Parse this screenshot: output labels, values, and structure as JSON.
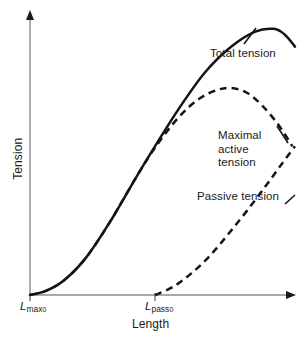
{
  "figure": {
    "background_color": "#ffffff",
    "ink_color": "#151515",
    "axis_color": "#8c8c8c"
  },
  "axes": {
    "y_label": "Tension",
    "x_label": "Length",
    "x_tick_labels": [
      {
        "base": "L",
        "sub": "max",
        "subsub": "0"
      },
      {
        "base": "L",
        "sub": "pass",
        "subsub": "0"
      }
    ]
  },
  "curve_labels": {
    "total": "Total tension",
    "active_line1": "Maximal",
    "active_line2": "active",
    "active_line3": "tension",
    "passive": "Passive tension"
  },
  "chart_data": {
    "type": "line",
    "xlabel": "Length",
    "ylabel": "Tension",
    "xlim": [
      0,
      1
    ],
    "ylim": [
      0,
      1
    ],
    "grid": false,
    "legend": "inline-annotations",
    "axis_ticks": {
      "x": [
        {
          "label": "Lmax0",
          "x": 0.0
        },
        {
          "label": "Lpass0",
          "x": 0.472
        }
      ],
      "y": []
    },
    "series": [
      {
        "name": "Total tension",
        "style": "solid",
        "points": [
          [
            0.0,
            0.0
          ],
          [
            0.06,
            0.015
          ],
          [
            0.13,
            0.055
          ],
          [
            0.21,
            0.135
          ],
          [
            0.3,
            0.265
          ],
          [
            0.4,
            0.43
          ],
          [
            0.472,
            0.545
          ],
          [
            0.56,
            0.68
          ],
          [
            0.66,
            0.815
          ],
          [
            0.76,
            0.91
          ],
          [
            0.85,
            0.965
          ],
          [
            0.92,
            0.975
          ],
          [
            0.96,
            0.955
          ],
          [
            1.0,
            0.91
          ]
        ]
      },
      {
        "name": "Maximal active tension",
        "style": "dashed",
        "points": [
          [
            0.0,
            0.0
          ],
          [
            0.06,
            0.015
          ],
          [
            0.13,
            0.055
          ],
          [
            0.21,
            0.135
          ],
          [
            0.3,
            0.265
          ],
          [
            0.4,
            0.43
          ],
          [
            0.472,
            0.54
          ],
          [
            0.56,
            0.65
          ],
          [
            0.64,
            0.72
          ],
          [
            0.71,
            0.752
          ],
          [
            0.76,
            0.758
          ],
          [
            0.82,
            0.74
          ],
          [
            0.88,
            0.69
          ],
          [
            0.94,
            0.62
          ],
          [
            0.99,
            0.545
          ]
        ]
      },
      {
        "name": "Passive tension",
        "style": "dashed",
        "points": [
          [
            0.472,
            0.0
          ],
          [
            0.54,
            0.03
          ],
          [
            0.61,
            0.08
          ],
          [
            0.68,
            0.145
          ],
          [
            0.75,
            0.225
          ],
          [
            0.82,
            0.31
          ],
          [
            0.89,
            0.4
          ],
          [
            0.95,
            0.48
          ],
          [
            1.0,
            0.545
          ]
        ]
      }
    ],
    "annotations": [
      {
        "text": "Total tension",
        "x": 0.7,
        "y": 0.845,
        "leader_to": [
          0.82,
          0.93
        ]
      },
      {
        "text": "Maximal active tension",
        "x": 0.73,
        "y": 0.545,
        "leader_to": [
          0.92,
          0.63
        ]
      },
      {
        "text": "Passive tension",
        "x": 0.64,
        "y": 0.335,
        "leader_to": [
          0.93,
          0.31
        ]
      }
    ]
  }
}
